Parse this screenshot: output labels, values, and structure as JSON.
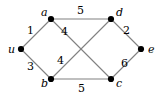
{
  "figure": {
    "kind": "weighted-undirected-graph",
    "background_color": "#ffffff",
    "edge_color": "#808080",
    "vertex_color": "#000000",
    "label_color": "#000000"
  },
  "vertices": [
    {
      "id": "u",
      "label": "u",
      "x": 21,
      "y": 49,
      "label_x": 8,
      "label_y": 44
    },
    {
      "id": "a",
      "label": "a",
      "x": 51,
      "y": 19,
      "label_x": 41,
      "label_y": 7
    },
    {
      "id": "b",
      "label": "b",
      "x": 51,
      "y": 79,
      "label_x": 41,
      "label_y": 78
    },
    {
      "id": "d",
      "label": "d",
      "x": 111,
      "y": 19,
      "label_x": 116,
      "label_y": 7
    },
    {
      "id": "c",
      "label": "c",
      "x": 111,
      "y": 79,
      "label_x": 116,
      "label_y": 78
    },
    {
      "id": "e",
      "label": "e",
      "x": 141,
      "y": 49,
      "label_x": 148,
      "label_y": 44
    }
  ],
  "edges": [
    {
      "id": "u-a",
      "from": "u",
      "to": "a",
      "weight": "1",
      "label_x": 27,
      "label_y": 25
    },
    {
      "id": "u-b",
      "from": "u",
      "to": "b",
      "weight": "3",
      "label_x": 27,
      "label_y": 61
    },
    {
      "id": "a-d",
      "from": "a",
      "to": "d",
      "weight": "5",
      "label_x": 77,
      "label_y": 5
    },
    {
      "id": "a-c",
      "from": "a",
      "to": "c",
      "weight": "4",
      "label_x": 61,
      "label_y": 26
    },
    {
      "id": "b-d",
      "from": "b",
      "to": "d",
      "weight": "4",
      "label_x": 57,
      "label_y": 55
    },
    {
      "id": "b-c",
      "from": "b",
      "to": "c",
      "weight": "5",
      "label_x": 78,
      "label_y": 83
    },
    {
      "id": "d-e",
      "from": "d",
      "to": "e",
      "weight": "2",
      "label_x": 123,
      "label_y": 25
    },
    {
      "id": "c-e",
      "from": "c",
      "to": "e",
      "weight": "6",
      "label_x": 121,
      "label_y": 58
    }
  ]
}
